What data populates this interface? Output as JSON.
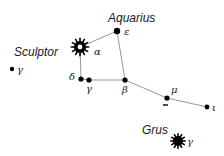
{
  "diagram": {
    "type": "star-chart",
    "background": "#ffffff",
    "line_color": "#8a8a8a",
    "star_color": "#000000",
    "constellations": [
      {
        "name": "Aquarius",
        "label_x": 108,
        "label_y": 22
      },
      {
        "name": "Sculptor",
        "label_x": 14,
        "label_y": 56
      },
      {
        "name": "Grus",
        "label_x": 142,
        "label_y": 134
      }
    ],
    "stars": [
      {
        "id": "epsilon",
        "label": "ε",
        "x": 117,
        "y": 31,
        "kind": "dot",
        "r": 3.2,
        "label_dx": 7,
        "label_dy": 4
      },
      {
        "id": "alpha",
        "label": "α",
        "x": 80,
        "y": 47,
        "kind": "burst-hollow",
        "r": 6,
        "label_dx": 14,
        "label_dy": 8
      },
      {
        "id": "sculptor-gamma",
        "label": "γ",
        "x": 12,
        "y": 69,
        "kind": "dot",
        "r": 2.2,
        "label_dx": 5,
        "label_dy": 4
      },
      {
        "id": "delta",
        "label": "δ",
        "x": 81,
        "y": 79,
        "kind": "dot",
        "r": 2.6,
        "label_dx": -12,
        "label_dy": 1
      },
      {
        "id": "gamma",
        "label": "γ",
        "x": 89,
        "y": 80,
        "kind": "dot",
        "r": 2.6,
        "label_dx": -3,
        "label_dy": 12
      },
      {
        "id": "beta",
        "label": "β",
        "x": 125,
        "y": 80,
        "kind": "dot",
        "r": 2.6,
        "label_dx": -3,
        "label_dy": 13
      },
      {
        "id": "mu",
        "label": "μ",
        "x": 167,
        "y": 98,
        "kind": "dot",
        "r": 2.6,
        "label_dx": 4,
        "label_dy": -5
      },
      {
        "id": "iota",
        "label": "ι",
        "x": 207,
        "y": 107,
        "kind": "dot",
        "r": 2.4,
        "label_dx": 5,
        "label_dy": 4
      },
      {
        "id": "grus-gamma",
        "label": "γ",
        "x": 178,
        "y": 141,
        "kind": "burst-solid",
        "r": 5,
        "label_dx": 9,
        "label_dy": 4
      }
    ],
    "lines": [
      [
        "alpha",
        "epsilon"
      ],
      [
        "alpha",
        "delta"
      ],
      [
        "delta",
        "gamma"
      ],
      [
        "gamma",
        "beta"
      ],
      [
        "epsilon",
        "beta"
      ],
      [
        "beta",
        "mu"
      ],
      [
        "mu",
        "iota"
      ]
    ],
    "markers": [
      {
        "id": "mu-tick",
        "x1": 163,
        "y1": 105,
        "x2": 168,
        "y2": 105
      }
    ]
  }
}
